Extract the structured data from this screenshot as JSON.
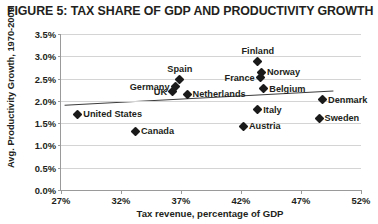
{
  "figure": {
    "title": "FIGURE 5: TAX SHARE OF GDP AND PRODUCTIVITY GROWTH"
  },
  "chart_data": {
    "type": "scatter",
    "title": "FIGURE 5: TAX SHARE OF GDP AND PRODUCTIVITY GROWTH",
    "xlabel": "Tax revenue, percentage of GDP",
    "ylabel": "Avg. Productivity Growth, 1970-2009",
    "xlim": [
      27,
      52
    ],
    "ylim": [
      0.0,
      3.5
    ],
    "xticks": [
      "27%",
      "32%",
      "37%",
      "42%",
      "47%",
      "52%"
    ],
    "xtick_values": [
      27,
      32,
      37,
      42,
      47,
      52
    ],
    "yticks": [
      "0.0%",
      "0.5%",
      "1.0%",
      "1.5%",
      "2.0%",
      "2.5%",
      "3.0%",
      "3.5%"
    ],
    "ytick_values": [
      0.0,
      0.5,
      1.0,
      1.5,
      2.0,
      2.5,
      3.0,
      3.5
    ],
    "grid": "horizontal",
    "legend": "none",
    "marker_color": "#1a1a1a",
    "marker_shape": "diamond",
    "trendline": {
      "color": "#3c3c3c",
      "x_start": 27.3,
      "y_start": 1.9,
      "x_end": 49.7,
      "y_end": 2.22
    },
    "points": [
      {
        "label": "United States",
        "x": 28.4,
        "y": 1.7,
        "label_side": "right"
      },
      {
        "label": "Canada",
        "x": 33.2,
        "y": 1.32,
        "label_side": "right"
      },
      {
        "label": "UK",
        "x": 36.3,
        "y": 2.2,
        "label_side": "left"
      },
      {
        "label": "Germany",
        "x": 36.5,
        "y": 2.32,
        "label_side": "left"
      },
      {
        "label": "Spain",
        "x": 36.9,
        "y": 2.47,
        "label_side": "above"
      },
      {
        "label": "Netherlands",
        "x": 37.5,
        "y": 2.15,
        "label_side": "right"
      },
      {
        "label": "Austria",
        "x": 42.2,
        "y": 1.43,
        "label_side": "right"
      },
      {
        "label": "Italy",
        "x": 43.4,
        "y": 1.8,
        "label_side": "right"
      },
      {
        "label": "Finland",
        "x": 43.4,
        "y": 2.88,
        "label_side": "above"
      },
      {
        "label": "France",
        "x": 43.6,
        "y": 2.52,
        "label_side": "left"
      },
      {
        "label": "Norway",
        "x": 43.7,
        "y": 2.64,
        "label_side": "right"
      },
      {
        "label": "Belgium",
        "x": 43.9,
        "y": 2.27,
        "label_side": "right"
      },
      {
        "label": "Sweden",
        "x": 48.5,
        "y": 1.61,
        "label_side": "right"
      },
      {
        "label": "Denmark",
        "x": 48.8,
        "y": 2.02,
        "label_side": "right"
      }
    ]
  }
}
